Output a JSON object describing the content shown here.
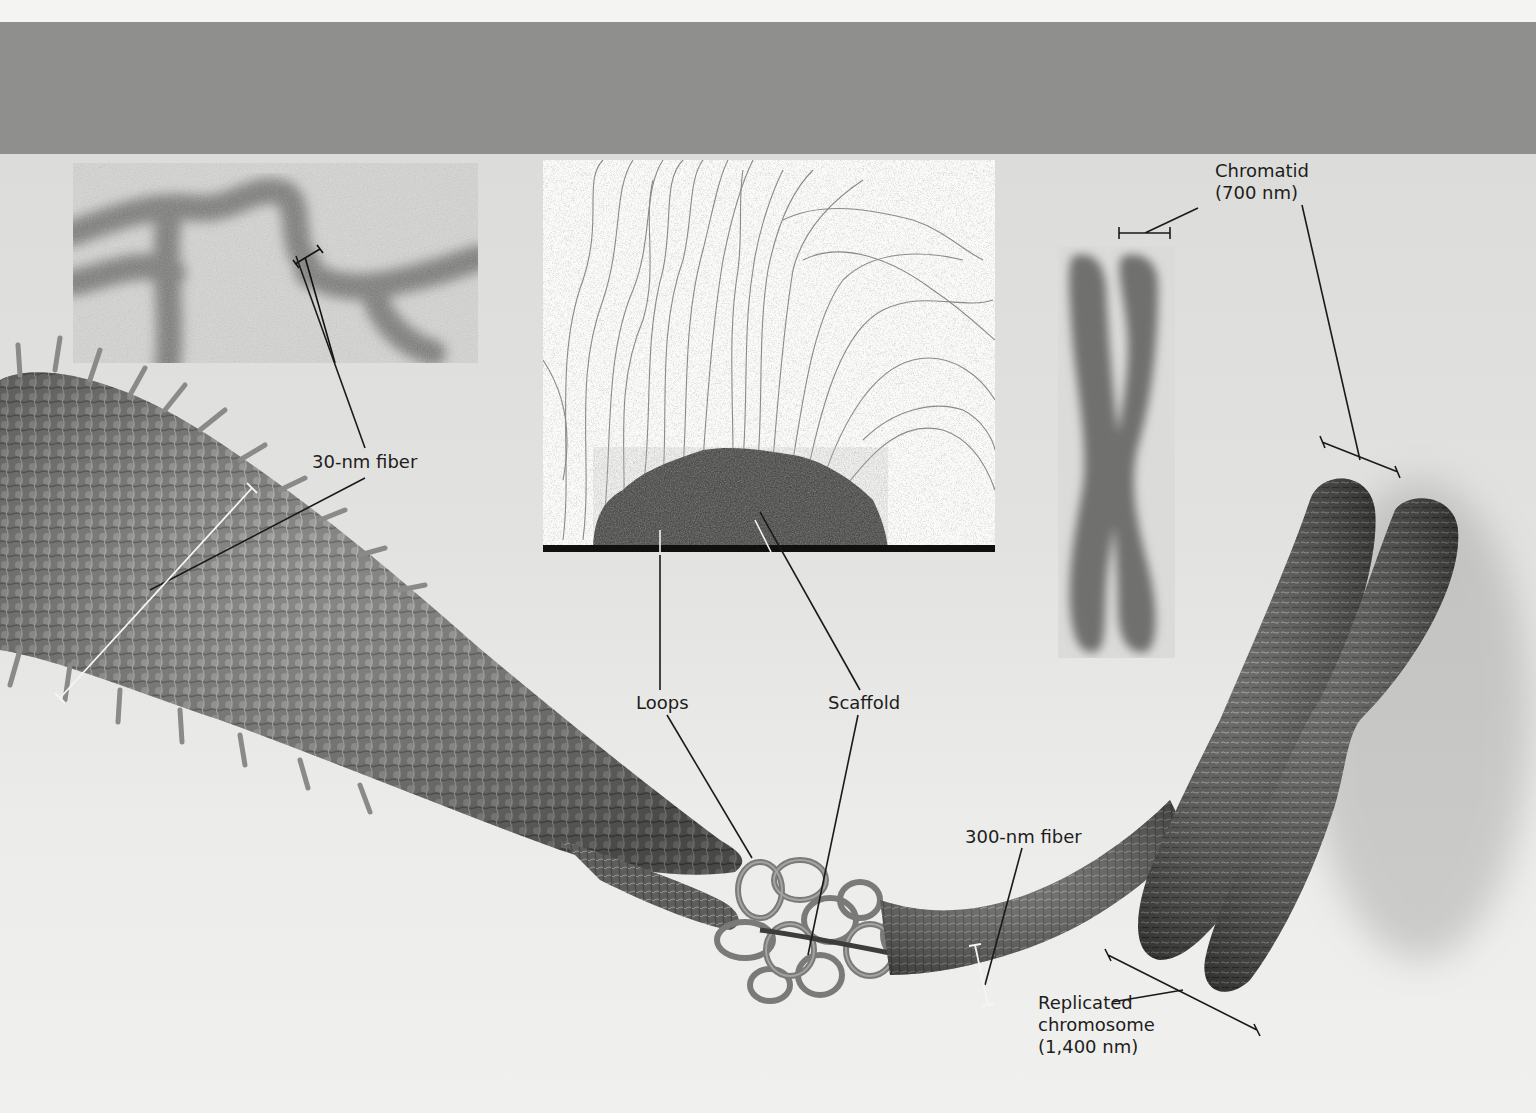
{
  "figure": {
    "title": "",
    "header_band_color": "#8f8f8d",
    "background_color": "#e6e6e4"
  },
  "micrographs": [
    {
      "id": "em-30nm-fiber",
      "description": "electron micrograph of 30-nm chromatin fiber"
    },
    {
      "id": "em-loops-scaffold",
      "description": "electron micrograph of DNA loops radiating from protein scaffold"
    },
    {
      "id": "em-metaphase-chromosome",
      "description": "electron micrograph of replicated chromosome (two chromatids)"
    }
  ],
  "labels": {
    "fiber_30nm": "30-nm fiber",
    "loops": "Loops",
    "scaffold": "Scaffold",
    "fiber_300nm": "300-nm fiber",
    "chromatid_line1": "Chromatid",
    "chromatid_line2": "(700 nm)",
    "replicated_line1": "Replicated",
    "replicated_line2": "chromosome",
    "replicated_line3": "(1,400 nm)"
  }
}
